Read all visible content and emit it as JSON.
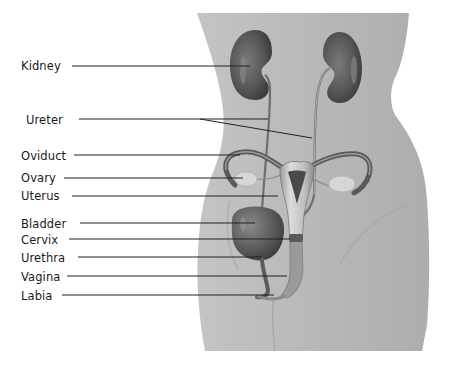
{
  "diagram": {
    "colors": {
      "background": "#ffffff",
      "body": "#b9b9b9",
      "organ_dark": "#5a5a5a",
      "organ_mid": "#8a8a8a",
      "organ_light": "#d4d4d4",
      "leader_line": "#222222",
      "label_text": "#1a1a1a"
    },
    "labels": [
      {
        "id": "kidney",
        "text": "Kidney",
        "x": 21,
        "y": 66,
        "line": {
          "x1": 72,
          "y1": 66,
          "x2": 250,
          "y2": 66
        }
      },
      {
        "id": "ureter",
        "text": "Ureter",
        "x": 26,
        "y": 120,
        "line": {
          "x1": 79,
          "y1": 119,
          "x2": 268,
          "y2": 119
        },
        "line2": {
          "x1": 200,
          "y1": 119,
          "x2": 312,
          "y2": 138
        }
      },
      {
        "id": "oviduct",
        "text": "Oviduct",
        "x": 21,
        "y": 156,
        "line": {
          "x1": 74,
          "y1": 155,
          "x2": 240,
          "y2": 155
        }
      },
      {
        "id": "ovary",
        "text": "Ovary",
        "x": 21,
        "y": 178,
        "line": {
          "x1": 64,
          "y1": 178,
          "x2": 243,
          "y2": 178
        }
      },
      {
        "id": "uterus",
        "text": "Uterus",
        "x": 21,
        "y": 196,
        "line": {
          "x1": 72,
          "y1": 196,
          "x2": 278,
          "y2": 196
        }
      },
      {
        "id": "bladder",
        "text": "Bladder",
        "x": 21,
        "y": 224,
        "line": {
          "x1": 80,
          "y1": 223,
          "x2": 255,
          "y2": 223
        }
      },
      {
        "id": "cervix",
        "text": "Cervix",
        "x": 21,
        "y": 240,
        "line": {
          "x1": 69,
          "y1": 239,
          "x2": 290,
          "y2": 239
        }
      },
      {
        "id": "urethra",
        "text": "Urethra",
        "x": 21,
        "y": 258,
        "line": {
          "x1": 78,
          "y1": 257,
          "x2": 262,
          "y2": 257
        }
      },
      {
        "id": "vagina",
        "text": "Vagina",
        "x": 21,
        "y": 277,
        "line": {
          "x1": 67,
          "y1": 276,
          "x2": 287,
          "y2": 276
        }
      },
      {
        "id": "labia",
        "text": "Labia",
        "x": 21,
        "y": 296,
        "line": {
          "x1": 62,
          "y1": 295,
          "x2": 274,
          "y2": 295
        }
      }
    ]
  }
}
